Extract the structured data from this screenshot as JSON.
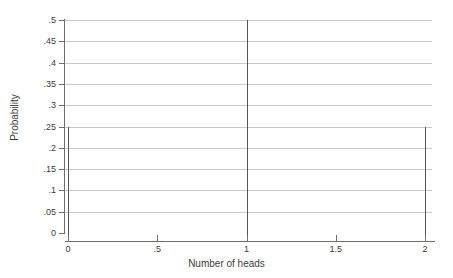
{
  "chart_data": {
    "type": "bar",
    "title": "",
    "subtitle": "",
    "xlabel": "Number of heads",
    "ylabel": "Probability",
    "x": [
      0,
      1,
      2
    ],
    "categories": [
      "0",
      "1",
      "2"
    ],
    "values": [
      0.25,
      0.5,
      0.25
    ],
    "series": [
      {
        "name": "Probability",
        "values": [
          0.25,
          0.5,
          0.25
        ]
      }
    ],
    "xlim": [
      0,
      2
    ],
    "ylim": [
      0,
      0.5
    ],
    "xticks": [
      0,
      0.5,
      1,
      1.5,
      2
    ],
    "xticklabels": [
      "0",
      ".5",
      "1",
      "1.5",
      "2"
    ],
    "yticks": [
      0,
      0.05,
      0.1,
      0.15,
      0.2,
      0.25,
      0.3,
      0.35,
      0.4,
      0.45,
      0.5
    ],
    "yticklabels": [
      "0",
      ".05",
      ".1",
      ".15",
      ".2",
      ".25",
      ".3",
      ".35",
      ".4",
      ".45",
      ".5"
    ],
    "grid": "horizontal",
    "legend": "none",
    "annotations": [],
    "colors": {
      "spike": "#555555",
      "gridline": "#c9c9c9",
      "axis": "#6e6e6e",
      "text": "#3c3c3c",
      "background": "#ffffff"
    }
  }
}
